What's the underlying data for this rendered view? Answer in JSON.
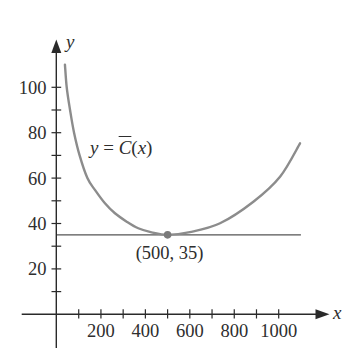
{
  "chart_data": {
    "type": "line",
    "title": "",
    "xlabel": "x",
    "ylabel": "y",
    "xlim": [
      0,
      1100
    ],
    "ylim": [
      0,
      110
    ],
    "grid": false,
    "legend": null,
    "x_ticks": [
      100,
      200,
      300,
      400,
      500,
      600,
      700,
      800,
      900,
      1000
    ],
    "x_tick_labels": [
      {
        "value": 200,
        "label": "200"
      },
      {
        "value": 400,
        "label": "400"
      },
      {
        "value": 600,
        "label": "600"
      },
      {
        "value": 800,
        "label": "800"
      },
      {
        "value": 1000,
        "label": "1000"
      }
    ],
    "y_ticks": [
      10,
      20,
      30,
      40,
      50,
      60,
      70,
      80,
      90,
      100
    ],
    "y_tick_labels": [
      {
        "value": 20,
        "label": "20"
      },
      {
        "value": 40,
        "label": "40"
      },
      {
        "value": 60,
        "label": "60"
      },
      {
        "value": 80,
        "label": "80"
      },
      {
        "value": 100,
        "label": "100"
      }
    ],
    "series": [
      {
        "name": "y = C̄(x)",
        "label_parts": {
          "var": "y",
          "eq": " = ",
          "func": "C",
          "open": "(",
          "arg": "x",
          "close": ")"
        },
        "color": "#8c8c8c",
        "x": [
          38,
          46,
          61,
          79,
          104,
          139,
          173,
          218,
          263,
          316,
          368,
          428,
          500,
          600,
          736,
          886,
          1006,
          1096
        ],
        "y": [
          110,
          100,
          90,
          80,
          70,
          60,
          54.8,
          48.9,
          44.5,
          40.8,
          37.9,
          36.1,
          35,
          36.2,
          40.1,
          49.6,
          60.6,
          75.3
        ]
      }
    ],
    "reference_line": {
      "y": 35,
      "x_start": 0,
      "x_end": 1100,
      "color": "#555555"
    },
    "annotations": [
      {
        "type": "point",
        "x": 500,
        "y": 35,
        "label": "(500, 35)",
        "color": "#7a7a7a"
      }
    ],
    "colors": {
      "axis": "#2a2a2a",
      "text": "#2e2e2e"
    }
  }
}
